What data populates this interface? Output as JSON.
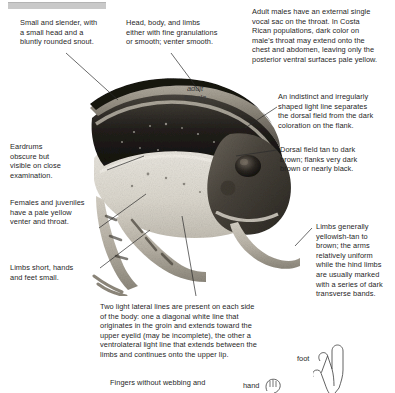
{
  "figure": {
    "photo_caption": "adult\nfemale",
    "photo_alt": "lateral view photograph of a slender frog with dark dorsal field and pale venter",
    "top_rule_color": "#c9c9c9",
    "text_color": "#1f1f1f"
  },
  "callouts": [
    {
      "id": "snout",
      "text": "Small and slender, with\na small head and a\nbluntly rounded snout."
    },
    {
      "id": "skin-texture",
      "text": "Head, body, and limbs\neither with fine granulations\nor smooth; venter smooth."
    },
    {
      "id": "vocal-sac",
      "text": "Adult males have an external single\nvocal sac on the throat. In Costa\nRican populations, dark color on\nmale's throat may extend onto the\nchest and abdomen, leaving only the\nposterior ventral surfaces pale yellow."
    },
    {
      "id": "light-line",
      "text": "An indistinct and irregularly\nshaped light line separates\nthe dorsal field from the dark\ncoloration on the flank."
    },
    {
      "id": "dorsal-field",
      "text": "Dorsal field tan to dark\nbrown; flanks very dark\nbrown or nearly black."
    },
    {
      "id": "eardrums",
      "text": "Eardrums\nobscure but\nvisible on close\nexamination."
    },
    {
      "id": "venter-throat",
      "text": "Females and juveniles\nhave a pale yellow\nventer and throat."
    },
    {
      "id": "limbs-short",
      "text": "Limbs short, hands\nand feet small."
    },
    {
      "id": "limb-color",
      "text": "Limbs generally\nyellowish-tan to\nbrown; the arms\nrelatively uniform\nwhile the hind limbs\nare usually marked\nwith a series of dark\ntransverse bands."
    },
    {
      "id": "lateral-lines",
      "text": "Two light lateral lines are present on each side\nof the body: one a diagonal white line that\noriginates in the groin and extends toward the\nupper eyelid (may be incomplete), the other a\nventrolateral light line that extends between the\nlimbs and continues onto the upper lip."
    },
    {
      "id": "fingers",
      "text": "Fingers without webbing and"
    }
  ],
  "limb_figures": [
    {
      "id": "hand",
      "label": "hand"
    },
    {
      "id": "foot",
      "label": "foot"
    }
  ]
}
